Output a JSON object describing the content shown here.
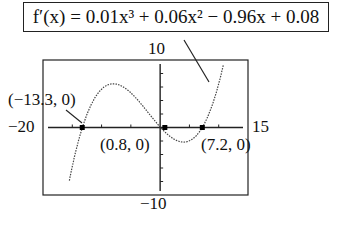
{
  "equation": {
    "label": "f′(x) = 0.01x³ + 0.06x² − 0.96x + 0.08"
  },
  "chart_data": {
    "type": "line",
    "title": "f′(x) = 0.01x³ + 0.06x² − 0.96x + 0.08",
    "function": "0.01x^3 + 0.06x^2 - 0.96x + 0.08",
    "xlim": [
      -20,
      15
    ],
    "ylim": [
      -10,
      10
    ],
    "grid": false,
    "window_labels": {
      "xmin": "−20",
      "xmax": "15",
      "ymax": "10",
      "ymin": "−10"
    },
    "zeros": [
      {
        "label": "(−13.3, 0)",
        "x": -13.3,
        "y": 0
      },
      {
        "label": "(0.8, 0)",
        "x": 0.8,
        "y": 0
      },
      {
        "label": "(7.2, 0)",
        "x": 7.2,
        "y": 0
      }
    ],
    "x_ticks": [
      -20,
      -15,
      -10,
      -5,
      0,
      5,
      10,
      15
    ],
    "y_ticks": [
      -10,
      -8,
      -6,
      -4,
      -2,
      0,
      2,
      4,
      6,
      8,
      10
    ]
  },
  "labels": {
    "ymax": "10",
    "ymin": "−10",
    "xmin": "−20",
    "xmax": "15",
    "zero1": "(−13.3, 0)",
    "zero2": "(0.8, 0)",
    "zero3": "(7.2, 0)"
  }
}
